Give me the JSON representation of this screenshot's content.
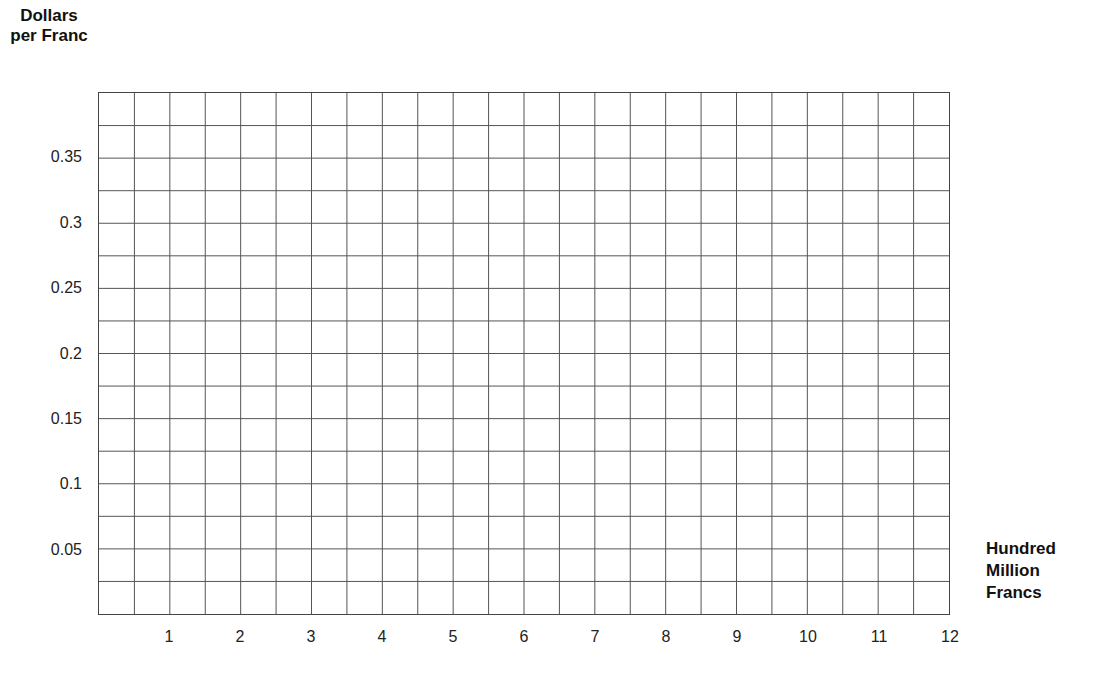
{
  "chart_data": {
    "type": "line",
    "title": "",
    "ylabel": "Dollars per Franc",
    "xlabel": "Hundred Million Francs",
    "ylabel_lines": [
      "Dollars",
      "per Franc"
    ],
    "xlabel_lines": [
      "Hundred",
      "Million",
      "Francs"
    ],
    "xlim": [
      0,
      12
    ],
    "ylim": [
      0,
      0.4
    ],
    "x_ticks": [
      1,
      2,
      3,
      4,
      5,
      6,
      7,
      8,
      9,
      10,
      11,
      12
    ],
    "x_tick_labels": [
      "1",
      "2",
      "3",
      "4",
      "5",
      "6",
      "7",
      "8",
      "9",
      "10",
      "11",
      "12"
    ],
    "y_ticks": [
      0.05,
      0.1,
      0.15,
      0.2,
      0.25,
      0.3,
      0.35
    ],
    "y_tick_labels": [
      "0.05",
      "0.1",
      "0.15",
      "0.2",
      "0.25",
      "0.3",
      "0.35"
    ],
    "grid": true,
    "grid_x_step": 0.5,
    "grid_y_step": 0.025,
    "series": []
  },
  "axis": {
    "y_title_line1": "Dollars",
    "y_title_line2": "per Franc",
    "x_title_line1": "Hundred",
    "x_title_line2": "Million",
    "x_title_line3": "Francs"
  },
  "colors": {
    "grid_line": "#555555",
    "text": "#1a1a1a",
    "background": "#ffffff"
  }
}
